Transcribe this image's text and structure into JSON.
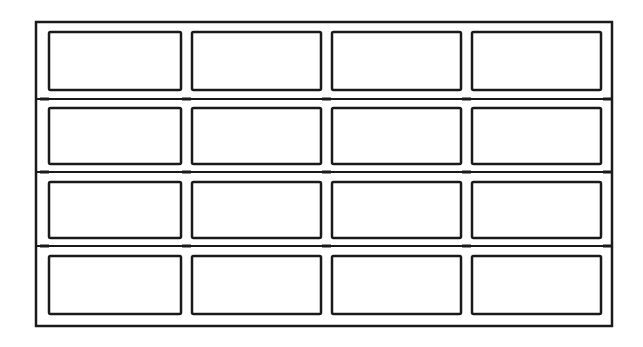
{
  "diagram": {
    "rows": 4,
    "columns": 4,
    "colors": {
      "line": "#1a1a1a",
      "background": "#ffffff"
    },
    "frame": {
      "x": 36,
      "y": 22,
      "width": 576,
      "height": 304
    },
    "row_dividers_y": [
      99,
      172,
      246
    ],
    "panel_columns": [
      {
        "x": 49,
        "width": 132
      },
      {
        "x": 192,
        "width": 129
      },
      {
        "x": 332,
        "width": 129
      },
      {
        "x": 472,
        "width": 129
      }
    ],
    "panel_rows": [
      {
        "y": 32,
        "height": 58
      },
      {
        "y": 108,
        "height": 56
      },
      {
        "y": 182,
        "height": 56
      },
      {
        "y": 256,
        "height": 58
      }
    ]
  }
}
